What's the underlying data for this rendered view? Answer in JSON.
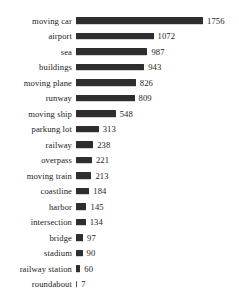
{
  "chart_data": {
    "type": "bar",
    "orientation": "horizontal",
    "title": "",
    "xlabel": "",
    "ylabel": "",
    "grid": false,
    "legend": "none",
    "xlim": [
      0,
      1756
    ],
    "value_labels_shown": true,
    "bar_color": "#2e2e2e",
    "background_color": "#ffffff",
    "categories": [
      "moving car",
      "airport",
      "sea",
      "buildings",
      "moving plane",
      "runway",
      "moving ship",
      "parkung lot",
      "railway",
      "overpass",
      "moving train",
      "coastline",
      "harbor",
      "intersection",
      "bridge",
      "stadium",
      "railway station",
      "roundabout"
    ],
    "values": [
      1756,
      1072,
      987,
      943,
      826,
      809,
      548,
      313,
      238,
      221,
      213,
      184,
      145,
      134,
      97,
      90,
      60,
      7
    ]
  }
}
